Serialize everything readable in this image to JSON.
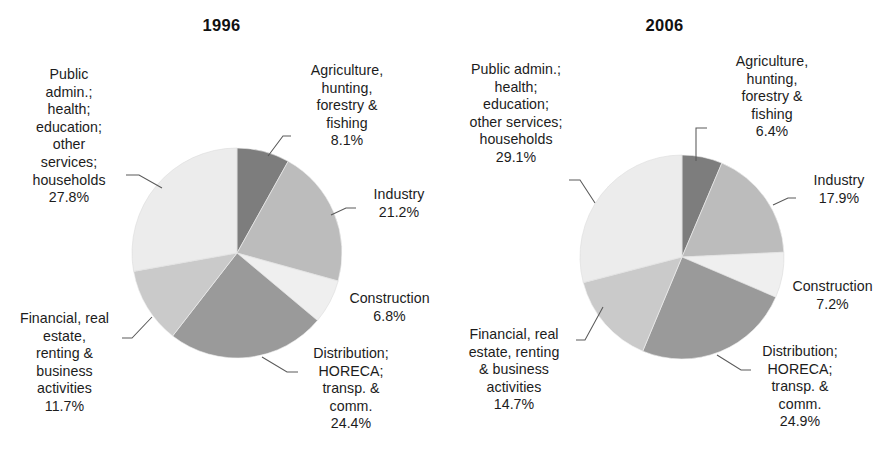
{
  "figure": {
    "background": "#ffffff",
    "panel_count": 2
  },
  "chart_data": [
    {
      "type": "pie",
      "title": "1996",
      "xlabel": "",
      "ylabel": "",
      "legend_position": "callout-labels",
      "grid": false,
      "start_angle_deg": 0,
      "direction": "clockwise",
      "categories": [
        "Agriculture, hunting, forestry & fishing",
        "Industry",
        "Construction",
        "Distribution; HORECA; transp. & comm.",
        "Financial, real estate, renting & business activities",
        "Public admin.; health; education; other services; households"
      ],
      "values": [
        8.1,
        21.2,
        6.8,
        24.4,
        11.7,
        27.8
      ],
      "value_labels": [
        "8.1%",
        "21.2%",
        "6.8%",
        "24.4%",
        "11.7%",
        "27.8%"
      ],
      "colors": [
        "#7d7d7d",
        "#bcbcbc",
        "#efefef",
        "#9a9a9a",
        "#cacaca",
        "#ececec"
      ],
      "labels": [
        {
          "name": "agriculture",
          "lines": "Agriculture,\nhunting,\nforestry &\nfishing\n8.1%",
          "value": "8.1%"
        },
        {
          "name": "industry",
          "lines": "Industry\n21.2%",
          "value": "21.2%"
        },
        {
          "name": "construction",
          "lines": "Construction\n6.8%",
          "value": "6.8%"
        },
        {
          "name": "distribution",
          "lines": "Distribution;\nHORECA;\ntransp. &\ncomm.\n24.4%",
          "value": "24.4%"
        },
        {
          "name": "financial",
          "lines": "Financial, real\nestate,\nrenting &\nbusiness\nactivities\n11.7%",
          "value": "11.7%"
        },
        {
          "name": "public-admin",
          "lines": "Public\nadmin.;\nhealth;\neducation;\nother\nservices;\nhouseholds\n27.8%",
          "value": "27.8%"
        }
      ]
    },
    {
      "type": "pie",
      "title": "2006",
      "xlabel": "",
      "ylabel": "",
      "legend_position": "callout-labels",
      "grid": false,
      "start_angle_deg": 0,
      "direction": "clockwise",
      "categories": [
        "Agriculture, hunting, forestry & fishing",
        "Industry",
        "Construction",
        "Distribution; HORECA; transp. & comm.",
        "Financial, real estate, renting & business activities",
        "Public admin.; health; education; other services; households"
      ],
      "values": [
        6.4,
        17.9,
        7.2,
        24.9,
        14.7,
        29.1
      ],
      "value_labels": [
        "6.4%",
        "17.9%",
        "7.2%",
        "24.9%",
        "14.7%",
        "29.1%"
      ],
      "colors": [
        "#7d7d7d",
        "#bcbcbc",
        "#efefef",
        "#9a9a9a",
        "#cacaca",
        "#ececec"
      ],
      "labels": [
        {
          "name": "agriculture",
          "lines": "Agriculture,\nhunting,\nforestry &\nfishing\n6.4%",
          "value": "6.4%"
        },
        {
          "name": "industry",
          "lines": "Industry\n17.9%",
          "value": "17.9%"
        },
        {
          "name": "construction",
          "lines": "Construction\n7.2%",
          "value": "7.2%"
        },
        {
          "name": "distribution",
          "lines": "Distribution;\nHORECA;\ntransp. &\ncomm.\n24.9%",
          "value": "24.9%"
        },
        {
          "name": "financial",
          "lines": "Financial, real\nestate, renting\n& business\nactivities\n14.7%",
          "value": "14.7%"
        },
        {
          "name": "public-admin",
          "lines": "Public admin.;\nhealth;\neducation;\nother services;\nhouseholds\n29.1%",
          "value": "29.1%"
        }
      ]
    }
  ]
}
